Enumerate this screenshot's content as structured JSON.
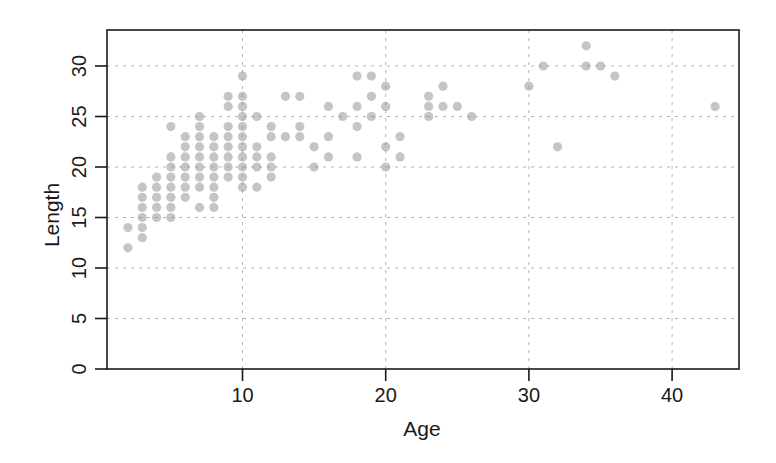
{
  "chart_data": {
    "type": "scatter",
    "title": "",
    "xlabel": "Age",
    "ylabel": "Length",
    "xlim": [
      0.5,
      44.7
    ],
    "ylim": [
      0,
      33.7
    ],
    "xticks": [
      10,
      20,
      30,
      40
    ],
    "yticks": [
      0,
      5,
      10,
      15,
      20,
      25,
      30
    ],
    "grid": true,
    "grid_style": "dotted",
    "legend": null,
    "marker": {
      "shape": "circle",
      "color": "#8c8c8c",
      "alpha": 0.5
    },
    "points": [
      {
        "x": 2,
        "y": 12
      },
      {
        "x": 2,
        "y": 14
      },
      {
        "x": 3,
        "y": 13
      },
      {
        "x": 3,
        "y": 14
      },
      {
        "x": 3,
        "y": 15
      },
      {
        "x": 3,
        "y": 16
      },
      {
        "x": 3,
        "y": 17
      },
      {
        "x": 3,
        "y": 18
      },
      {
        "x": 4,
        "y": 15
      },
      {
        "x": 4,
        "y": 16
      },
      {
        "x": 4,
        "y": 17
      },
      {
        "x": 4,
        "y": 18
      },
      {
        "x": 4,
        "y": 19
      },
      {
        "x": 5,
        "y": 15
      },
      {
        "x": 5,
        "y": 16
      },
      {
        "x": 5,
        "y": 17
      },
      {
        "x": 5,
        "y": 18
      },
      {
        "x": 5,
        "y": 19
      },
      {
        "x": 5,
        "y": 20
      },
      {
        "x": 5,
        "y": 21
      },
      {
        "x": 5,
        "y": 24
      },
      {
        "x": 6,
        "y": 17
      },
      {
        "x": 6,
        "y": 18
      },
      {
        "x": 6,
        "y": 19
      },
      {
        "x": 6,
        "y": 20
      },
      {
        "x": 6,
        "y": 21
      },
      {
        "x": 6,
        "y": 22
      },
      {
        "x": 6,
        "y": 23
      },
      {
        "x": 7,
        "y": 16
      },
      {
        "x": 7,
        "y": 18
      },
      {
        "x": 7,
        "y": 19
      },
      {
        "x": 7,
        "y": 20
      },
      {
        "x": 7,
        "y": 21
      },
      {
        "x": 7,
        "y": 22
      },
      {
        "x": 7,
        "y": 23
      },
      {
        "x": 7,
        "y": 24
      },
      {
        "x": 7,
        "y": 25
      },
      {
        "x": 8,
        "y": 16
      },
      {
        "x": 8,
        "y": 17
      },
      {
        "x": 8,
        "y": 18
      },
      {
        "x": 8,
        "y": 19
      },
      {
        "x": 8,
        "y": 20
      },
      {
        "x": 8,
        "y": 21
      },
      {
        "x": 8,
        "y": 22
      },
      {
        "x": 8,
        "y": 23
      },
      {
        "x": 9,
        "y": 19
      },
      {
        "x": 9,
        "y": 20
      },
      {
        "x": 9,
        "y": 21
      },
      {
        "x": 9,
        "y": 22
      },
      {
        "x": 9,
        "y": 23
      },
      {
        "x": 9,
        "y": 24
      },
      {
        "x": 9,
        "y": 26
      },
      {
        "x": 9,
        "y": 27
      },
      {
        "x": 10,
        "y": 18
      },
      {
        "x": 10,
        "y": 19
      },
      {
        "x": 10,
        "y": 20
      },
      {
        "x": 10,
        "y": 21
      },
      {
        "x": 10,
        "y": 22
      },
      {
        "x": 10,
        "y": 23
      },
      {
        "x": 10,
        "y": 24
      },
      {
        "x": 10,
        "y": 25
      },
      {
        "x": 10,
        "y": 26
      },
      {
        "x": 10,
        "y": 27
      },
      {
        "x": 10,
        "y": 29
      },
      {
        "x": 11,
        "y": 18
      },
      {
        "x": 11,
        "y": 20
      },
      {
        "x": 11,
        "y": 21
      },
      {
        "x": 11,
        "y": 22
      },
      {
        "x": 11,
        "y": 25
      },
      {
        "x": 12,
        "y": 19
      },
      {
        "x": 12,
        "y": 20
      },
      {
        "x": 12,
        "y": 21
      },
      {
        "x": 12,
        "y": 23
      },
      {
        "x": 12,
        "y": 24
      },
      {
        "x": 13,
        "y": 23
      },
      {
        "x": 13,
        "y": 27
      },
      {
        "x": 14,
        "y": 23
      },
      {
        "x": 14,
        "y": 24
      },
      {
        "x": 14,
        "y": 27
      },
      {
        "x": 15,
        "y": 20
      },
      {
        "x": 15,
        "y": 22
      },
      {
        "x": 16,
        "y": 21
      },
      {
        "x": 16,
        "y": 23
      },
      {
        "x": 16,
        "y": 26
      },
      {
        "x": 17,
        "y": 25
      },
      {
        "x": 18,
        "y": 21
      },
      {
        "x": 18,
        "y": 24
      },
      {
        "x": 18,
        "y": 26
      },
      {
        "x": 18,
        "y": 29
      },
      {
        "x": 19,
        "y": 25
      },
      {
        "x": 19,
        "y": 27
      },
      {
        "x": 19,
        "y": 29
      },
      {
        "x": 20,
        "y": 20
      },
      {
        "x": 20,
        "y": 22
      },
      {
        "x": 20,
        "y": 26
      },
      {
        "x": 20,
        "y": 28
      },
      {
        "x": 21,
        "y": 21
      },
      {
        "x": 21,
        "y": 23
      },
      {
        "x": 23,
        "y": 25
      },
      {
        "x": 23,
        "y": 26
      },
      {
        "x": 23,
        "y": 27
      },
      {
        "x": 24,
        "y": 26
      },
      {
        "x": 24,
        "y": 28
      },
      {
        "x": 25,
        "y": 26
      },
      {
        "x": 26,
        "y": 25
      },
      {
        "x": 30,
        "y": 28
      },
      {
        "x": 31,
        "y": 30
      },
      {
        "x": 32,
        "y": 22
      },
      {
        "x": 34,
        "y": 30
      },
      {
        "x": 34,
        "y": 32
      },
      {
        "x": 35,
        "y": 30
      },
      {
        "x": 36,
        "y": 29
      },
      {
        "x": 43,
        "y": 26
      }
    ]
  },
  "axes": {
    "x_title": "Age",
    "y_title": "Length",
    "x_tick_labels": [
      "10",
      "20",
      "30",
      "40"
    ],
    "y_tick_labels": [
      "0",
      "5",
      "10",
      "15",
      "20",
      "25",
      "30"
    ]
  }
}
